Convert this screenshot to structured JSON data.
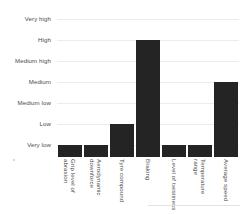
{
  "chart_data": {
    "type": "bar",
    "title": "",
    "subtitle": "",
    "xlabel": "",
    "ylabel": "",
    "orientation": "vertical",
    "grid": true,
    "legend": false,
    "legend_position": "none",
    "bar_color": "#242424",
    "gridline_color": "#ececed",
    "background_color": "#ffffff",
    "y_scale": "ordinal",
    "y_tick_labels": [
      "Very high",
      "High",
      "Medium high",
      "Medium",
      "Medium low",
      "Low",
      "Very low"
    ],
    "y_levels_bottom_to_top": [
      "Very low",
      "Low",
      "Medium low",
      "Medium",
      "Medium high",
      "High",
      "Very high"
    ],
    "ylim": [
      0,
      6
    ],
    "categories": [
      "Grip level of abrasion",
      "Aerodynamic downforce",
      "Tyre compound",
      "Braking",
      "Level of twistiness",
      "Temperature range",
      "Average speed"
    ],
    "values": [
      0,
      0,
      1,
      5,
      0,
      0,
      3
    ],
    "value_labels": [
      "Very low",
      "Very low",
      "Low",
      "High",
      "Very low",
      "Very low",
      "Medium"
    ]
  }
}
